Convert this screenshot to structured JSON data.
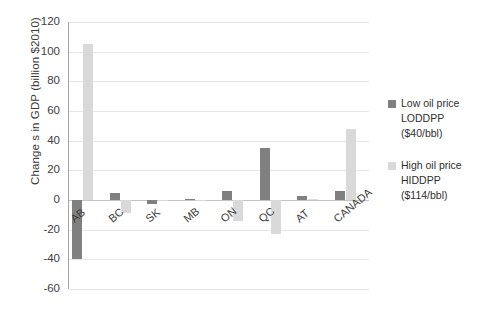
{
  "chart_data": {
    "type": "bar",
    "title": "",
    "subtitle": "",
    "xlabel": "",
    "ylabel": "Change s in GDP  (billion $2010)",
    "ylim": [
      -60,
      120
    ],
    "ytick_values": [
      120,
      100,
      80,
      60,
      40,
      20,
      0,
      -20,
      -40,
      -60
    ],
    "ytick_labels": [
      "120",
      "100",
      "80",
      "60",
      "40",
      "20",
      "0",
      "-20",
      "-40",
      "-60"
    ],
    "grid": true,
    "grid_axis": "y",
    "legend_position": "right",
    "categories": [
      "AB",
      "BC",
      "SK",
      "MB",
      "ON",
      "QC",
      "AT",
      "CANADA"
    ],
    "series": [
      {
        "name": "Low oil price LODDPP ($40/bbl)",
        "color": "#808080",
        "values": [
          -40,
          5,
          -3,
          0.5,
          6,
          35,
          3,
          6
        ]
      },
      {
        "name": "High oil price HIDDPP ($114/bbl)",
        "color": "#d9d9d9",
        "values": [
          105,
          -9,
          -1,
          0.3,
          -14,
          -23,
          1,
          48
        ]
      }
    ]
  },
  "legend": {
    "entries": [
      {
        "swatch_color": "#808080",
        "line1": "Low oil price",
        "line2": "LODDPP",
        "line3": "($40/bbl)"
      },
      {
        "swatch_color": "#d9d9d9",
        "line1": "High oil price",
        "line2": "HIDDPP",
        "line3": "($114/bbl)"
      }
    ]
  },
  "axis": {
    "y_title": "Change s in GDP  (billion $2010)"
  }
}
